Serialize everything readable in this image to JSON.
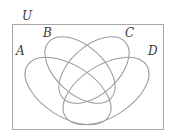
{
  "diagram": {
    "type": "venn",
    "universe_label": "U",
    "sets": [
      {
        "id": "A",
        "label": "A"
      },
      {
        "id": "B",
        "label": "B"
      },
      {
        "id": "C",
        "label": "C"
      },
      {
        "id": "D",
        "label": "D"
      }
    ],
    "colors": {
      "outline": "#9a9a9a",
      "box": "#a8a8a8",
      "text": "#3a3a3a",
      "background": "#ffffff"
    }
  }
}
